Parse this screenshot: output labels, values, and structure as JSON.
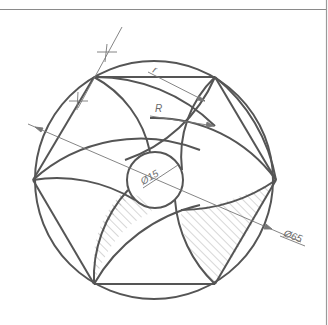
{
  "diagram": {
    "type": "technical-drawing",
    "colors": {
      "line": "#555555",
      "thin_line": "#7a7a7a",
      "hatch": "#9a9a9a",
      "frame": "#9a9a9a",
      "background": "#ffffff"
    },
    "outer_circle": {
      "cx": 154,
      "cy": 180,
      "r": 119
    },
    "inner_circle": {
      "cx": 155,
      "cy": 180,
      "r": 28
    },
    "hexagon_vertices": [
      [
        33,
        180
      ],
      [
        94,
        77
      ],
      [
        215,
        77
      ],
      [
        276,
        180
      ],
      [
        215,
        284
      ],
      [
        94,
        284
      ]
    ],
    "dimensions": {
      "outer_diameter_label": "Ø65",
      "inner_diameter_label": "Ø15",
      "large_radius_label": "R",
      "small_radius_label": "r"
    },
    "construction_marks": 2,
    "hatched_regions": 2
  }
}
